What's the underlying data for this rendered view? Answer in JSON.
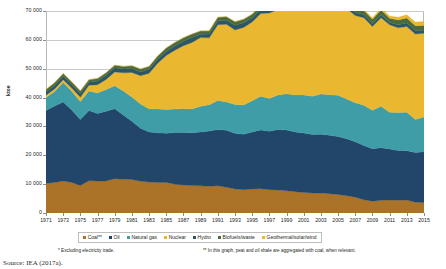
{
  "chart_data": {
    "type": "area",
    "stacked": true,
    "title": "",
    "xlabel": "",
    "ylabel": "ktoe",
    "ylim": [
      0,
      70000
    ],
    "ytick_values": [
      0,
      10000,
      20000,
      30000,
      40000,
      50000,
      60000,
      70000
    ],
    "ytick_labels": [
      "0",
      "10 000",
      "20 000",
      "30 000",
      "40 000",
      "50 000",
      "60 000",
      "70 000"
    ],
    "grid": true,
    "legend_position": "bottom",
    "x": [
      1971,
      1972,
      1973,
      1974,
      1975,
      1976,
      1977,
      1978,
      1979,
      1980,
      1981,
      1982,
      1983,
      1984,
      1985,
      1986,
      1987,
      1988,
      1989,
      1990,
      1991,
      1992,
      1993,
      1994,
      1995,
      1996,
      1997,
      1998,
      1999,
      2000,
      2001,
      2002,
      2003,
      2004,
      2005,
      2006,
      2007,
      2008,
      2009,
      2010,
      2011,
      2012,
      2013,
      2014,
      2015
    ],
    "xtick_labels": [
      "1971",
      "1973",
      "1975",
      "1977",
      "1979",
      "1981",
      "1983",
      "1985",
      "1987",
      "1989",
      "1991",
      "1993",
      "1995",
      "1997",
      "1999",
      "2001",
      "2003",
      "2005",
      "2007",
      "2009",
      "2011",
      "2013",
      "2015"
    ],
    "series": [
      {
        "name": "Coal**",
        "color": "#AB7328",
        "values": [
          10300,
          10600,
          11100,
          10600,
          9500,
          11200,
          11100,
          11100,
          11900,
          11700,
          11600,
          11000,
          10700,
          10600,
          10600,
          10000,
          9700,
          9500,
          9400,
          9300,
          9400,
          8900,
          8300,
          8100,
          8300,
          8400,
          8100,
          8000,
          7700,
          7400,
          7100,
          6900,
          6900,
          6700,
          6400,
          6000,
          5500,
          4600,
          4100,
          4400,
          4500,
          4400,
          4500,
          3700,
          3600
        ]
      },
      {
        "name": "Oil",
        "color": "#22466A",
        "values": [
          25200,
          26500,
          27400,
          25100,
          22900,
          24300,
          23400,
          24200,
          24200,
          22300,
          20200,
          18400,
          17400,
          17200,
          17000,
          17900,
          18200,
          18300,
          18700,
          19100,
          19500,
          19800,
          19300,
          19200,
          19800,
          20400,
          20200,
          20900,
          21100,
          20700,
          20600,
          20300,
          20400,
          20200,
          20100,
          19700,
          19200,
          18800,
          18200,
          18200,
          17700,
          17300,
          17100,
          17300,
          17600
        ]
      },
      {
        "name": "Natural gas",
        "color": "#3F9DA8",
        "values": [
          4500,
          5000,
          6700,
          6500,
          6200,
          6800,
          7100,
          7500,
          8000,
          8300,
          8400,
          8400,
          8000,
          8200,
          8300,
          8100,
          8300,
          8200,
          8900,
          9100,
          10100,
          9800,
          10000,
          10100,
          10800,
          11700,
          11400,
          12000,
          12500,
          12800,
          13200,
          13300,
          13900,
          14100,
          14300,
          13800,
          13500,
          13900,
          13300,
          14400,
          12700,
          13100,
          13300,
          11400,
          12100
        ]
      },
      {
        "name": "Nuclear",
        "color": "#E9B730",
        "values": [
          800,
          900,
          1000,
          1100,
          1500,
          2000,
          2800,
          3500,
          4800,
          6300,
          8500,
          9800,
          12300,
          15900,
          18700,
          20400,
          21800,
          23100,
          23800,
          23200,
          26200,
          26900,
          25800,
          26900,
          27300,
          28600,
          29600,
          29600,
          30700,
          30900,
          30200,
          30700,
          30800,
          31500,
          31600,
          31400,
          30200,
          30400,
          29000,
          30700,
          30300,
          29400,
          29700,
          29600,
          29000
        ]
      },
      {
        "name": "Hydro",
        "color": "#2C5668",
        "values": [
          1100,
          1200,
          1200,
          1200,
          1300,
          1000,
          1300,
          1400,
          1400,
          1300,
          1300,
          1300,
          1400,
          1400,
          1400,
          1500,
          1500,
          1700,
          1100,
          1300,
          1400,
          1400,
          1700,
          1600,
          1500,
          1400,
          1300,
          1300,
          1500,
          1400,
          1400,
          1200,
          1000,
          1000,
          1000,
          1000,
          1100,
          1000,
          1000,
          1000,
          800,
          1000,
          1200,
          1200,
          1000
        ]
      },
      {
        "name": "Biofuels/waste",
        "color": "#4A6B3C",
        "values": [
          900,
          900,
          900,
          900,
          900,
          900,
          900,
          900,
          900,
          900,
          1000,
          1000,
          1000,
          1100,
          1200,
          1200,
          1200,
          1200,
          1200,
          1100,
          1200,
          1200,
          1200,
          1200,
          1200,
          1300,
          1200,
          1200,
          1200,
          1200,
          1200,
          1200,
          1300,
          1300,
          1400,
          1400,
          1400,
          1500,
          1500,
          1700,
          1500,
          1700,
          1800,
          1700,
          1700
        ]
      },
      {
        "name": "Geothermal/solar/wind",
        "color": "#E9B730",
        "values": [
          10,
          10,
          10,
          10,
          10,
          10,
          10,
          10,
          10,
          10,
          10,
          10,
          10,
          10,
          10,
          10,
          10,
          10,
          10,
          20,
          20,
          20,
          20,
          30,
          30,
          30,
          40,
          40,
          50,
          60,
          70,
          80,
          100,
          130,
          170,
          220,
          300,
          400,
          520,
          650,
          800,
          950,
          1100,
          1250,
          1400
        ]
      }
    ],
    "totals_note": "Total primary energy supply peaks near 60 000 ktoe around 2010 and declines to about 52 000 ktoe by 2015."
  },
  "legend": {
    "items": [
      {
        "label": "Coal**",
        "color": "#AB7328"
      },
      {
        "label": "Oil",
        "color": "#22466A"
      },
      {
        "label": "Natural gas",
        "color": "#3F9DA8"
      },
      {
        "label": "Nuclear",
        "color": "#E9B730"
      },
      {
        "label": "Hydro",
        "color": "#2C5668"
      },
      {
        "label": "Biofuels/waste",
        "color": "#4A6B3C"
      },
      {
        "label": "Geothermal/solar/wind",
        "color": "#E9B730"
      }
    ]
  },
  "footnotes": {
    "first": "*  Excluding electricity trade.",
    "second": "**  In this graph, peat and oil shale are aggregated with coal, when relevant."
  },
  "source": {
    "text": "Source: IEA (2017a)."
  },
  "colors": {
    "gridline": "#c9c9c9",
    "frame": "#b9b9b9",
    "text": "#231f20"
  }
}
